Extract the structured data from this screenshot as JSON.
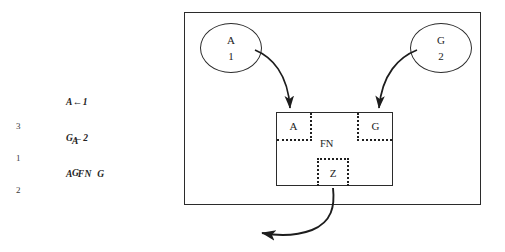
{
  "figure": {
    "code_listing": {
      "lines": [
        "A←1",
        "G←2",
        "A  FN  G"
      ]
    },
    "trace": {
      "entries": [
        {
          "number": "3",
          "value": ""
        },
        {
          "number": "",
          "value": "A"
        },
        {
          "number": "1",
          "value": ""
        },
        {
          "number": "",
          "value": "G"
        },
        {
          "number": "2",
          "value": ""
        }
      ],
      "margin_numbers": [
        "3",
        "1",
        "2"
      ],
      "values": [
        "A",
        "G"
      ]
    },
    "outer_frame": {
      "label": ""
    },
    "nodes": [
      {
        "id": "node-a",
        "name": "A",
        "value": "1"
      },
      {
        "id": "node-g",
        "name": "G",
        "value": "2"
      }
    ],
    "function_box": {
      "title": "FN",
      "left_cell": "A",
      "right_cell": "G",
      "result_cell": "Z"
    },
    "arrows": [
      {
        "id": "arrow-a-to-box",
        "from": "A",
        "to": "A-cell"
      },
      {
        "id": "arrow-g-to-box",
        "from": "G",
        "to": "G-cell"
      },
      {
        "id": "arrow-result-out",
        "from": "Z",
        "to": "output"
      }
    ],
    "colors": {
      "stroke": "#2b2b2b",
      "dotted": "#1f1f1f",
      "text": "#232323",
      "background": "#ffffff"
    }
  }
}
